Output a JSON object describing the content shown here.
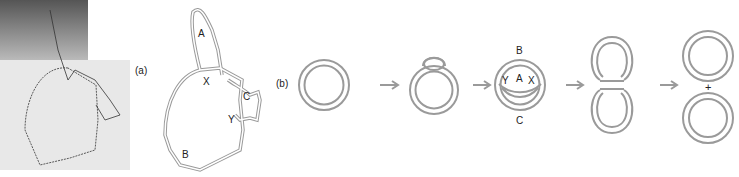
{
  "figure": {
    "panel_a": {
      "label": "(a)",
      "photo_description": "electron micrograph of DNA molecule",
      "tracing_labels": {
        "A": "A",
        "X": "X",
        "C": "C",
        "Y": "Y",
        "B": "B"
      }
    },
    "panel_b": {
      "label": "(b)",
      "stages": [
        {
          "name": "circle"
        },
        {
          "name": "circle-with-bubble"
        },
        {
          "name": "theta-structure",
          "labels": {
            "B": "B",
            "Y": "Y",
            "A": "A",
            "X": "X",
            "C": "C"
          }
        },
        {
          "name": "figure-eight"
        },
        {
          "name": "two-circles",
          "plus": "+"
        }
      ],
      "arrow": "→"
    },
    "colors": {
      "strand": "#9a9a9a",
      "text": "#222222"
    }
  }
}
